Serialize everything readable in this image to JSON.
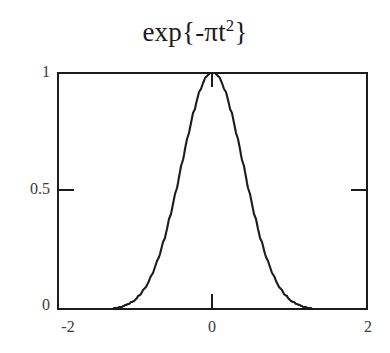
{
  "figure": {
    "background_color": "#ffffff",
    "line_color": "#1c1c1c",
    "text_color": "#3a3a3a"
  },
  "title": {
    "prefix": "exp{-πt",
    "exponent": "2",
    "suffix": "}",
    "full": "exp{-πt²}"
  },
  "axes": {
    "y_ticks": [
      "1",
      "0.5",
      "0"
    ],
    "x_ticks": [
      "-2",
      "0",
      "2"
    ]
  },
  "chart_data": {
    "type": "line",
    "xlabel": "",
    "ylabel": "",
    "xlim": [
      -2,
      2
    ],
    "ylim": [
      0,
      1
    ],
    "grid": false,
    "legend": null,
    "xticks": [
      -2,
      0,
      2
    ],
    "xticklabels": [
      "-2",
      "0",
      "2"
    ],
    "yticks": [
      0,
      0.5,
      1
    ],
    "yticklabels": [
      "0",
      "0.5",
      "1"
    ],
    "function": "exp(-pi*t^2)",
    "series": [
      {
        "name": "exp{-πt²}",
        "color": "#1c1c1c",
        "x": [
          -2.0,
          -1.9,
          -1.8,
          -1.7,
          -1.6,
          -1.5,
          -1.4,
          -1.3,
          -1.2,
          -1.1,
          -1.0,
          -0.9,
          -0.8,
          -0.7,
          -0.6,
          -0.5,
          -0.4,
          -0.3,
          -0.2,
          -0.1,
          0.0,
          0.1,
          0.2,
          0.3,
          0.4,
          0.5,
          0.6,
          0.7,
          0.8,
          0.9,
          1.0,
          1.1,
          1.2,
          1.3,
          1.4,
          1.5,
          1.6,
          1.7,
          1.8,
          1.9,
          2.0
        ],
        "y": [
          0.0,
          0.0,
          0.0,
          0.0001,
          0.0003,
          0.0008,
          0.0021,
          0.0051,
          0.0116,
          0.0227,
          0.0432,
          0.0786,
          0.1353,
          0.2187,
          0.3263,
          0.4559,
          0.6057,
          0.7548,
          0.8819,
          0.9691,
          1.0,
          0.9691,
          0.8819,
          0.7548,
          0.6057,
          0.4559,
          0.3263,
          0.2187,
          0.1353,
          0.0786,
          0.0432,
          0.0227,
          0.0116,
          0.0051,
          0.0021,
          0.0008,
          0.0003,
          0.0001,
          0.0,
          0.0,
          0.0
        ]
      }
    ]
  }
}
